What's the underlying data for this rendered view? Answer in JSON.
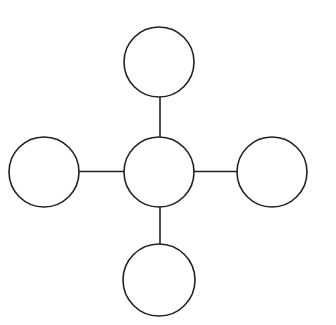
{
  "diagram": {
    "type": "star-network",
    "colors": {
      "stroke": "#222222",
      "fill": "#ffffff",
      "background": "#ffffff"
    },
    "nodes": [
      {
        "id": "center",
        "label": "",
        "cx": 159,
        "cy": 172,
        "r": 35
      },
      {
        "id": "top",
        "label": "",
        "cx": 159,
        "cy": 62,
        "r": 35
      },
      {
        "id": "left",
        "label": "",
        "cx": 44,
        "cy": 172,
        "r": 35
      },
      {
        "id": "right",
        "label": "",
        "cx": 272,
        "cy": 172,
        "r": 35
      },
      {
        "id": "bottom",
        "label": "",
        "cx": 159,
        "cy": 280,
        "r": 36
      }
    ],
    "edges": [
      {
        "from": "center",
        "to": "top"
      },
      {
        "from": "center",
        "to": "left"
      },
      {
        "from": "center",
        "to": "right"
      },
      {
        "from": "center",
        "to": "bottom"
      }
    ]
  }
}
